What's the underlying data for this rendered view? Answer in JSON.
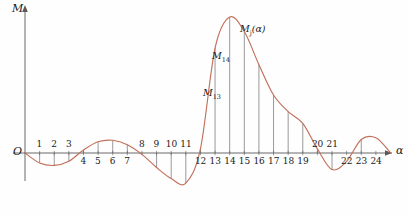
{
  "figure": {
    "axis_labels": {
      "y": "M",
      "x": "α",
      "origin": "O"
    },
    "annotations": [
      {
        "name": "M13",
        "text": "M",
        "subscript": "13",
        "x": 203,
        "y": 88
      },
      {
        "name": "M14",
        "text": "M",
        "subscript": "14",
        "x": 212,
        "y": 51
      },
      {
        "name": "Mj-alpha",
        "text": "M",
        "subscript": "j",
        "suffix": "(α)",
        "x": 240,
        "y": 24
      }
    ],
    "curve_color": "#c1705a",
    "axis_color": "#5a5a5a",
    "dropline_color": "#6e6e6e",
    "tick_labels": [
      "1",
      "2",
      "3",
      "4",
      "5",
      "6",
      "7",
      "8",
      "9",
      "10",
      "11",
      "12",
      "13",
      "14",
      "15",
      "16",
      "17",
      "18",
      "19",
      "20",
      "21",
      "22",
      "23",
      "24"
    ]
  },
  "chart_data": {
    "type": "line",
    "title": "",
    "xlabel": "α",
    "ylabel": "M",
    "xlim": [
      0,
      25.5
    ],
    "ylim": [
      -0.38,
      1.05
    ],
    "grid": false,
    "legend": "none",
    "series": [
      {
        "name": "M_j(alpha)",
        "color": "#c1705a",
        "x": [
          0,
          1,
          2,
          3,
          4,
          5,
          6,
          7,
          8,
          9,
          10,
          11,
          12,
          13,
          14,
          15,
          16,
          17,
          18,
          19,
          20,
          21,
          22,
          23,
          24,
          25
        ],
        "y": [
          0.0,
          -0.072,
          -0.09,
          -0.06,
          0.022,
          0.082,
          0.092,
          0.06,
          -0.01,
          -0.105,
          -0.185,
          -0.218,
          0.03,
          0.76,
          0.985,
          0.88,
          0.64,
          0.42,
          0.3,
          0.215,
          0.03,
          -0.12,
          -0.06,
          0.098,
          0.11,
          0.002
        ]
      }
    ],
    "droplines": [
      {
        "x": 1,
        "y": -0.072
      },
      {
        "x": 2,
        "y": -0.09
      },
      {
        "x": 3,
        "y": -0.06
      },
      {
        "x": 4,
        "y": 0.022
      },
      {
        "x": 5,
        "y": 0.082
      },
      {
        "x": 6,
        "y": 0.092
      },
      {
        "x": 7,
        "y": 0.06
      },
      {
        "x": 8,
        "y": -0.01
      },
      {
        "x": 9,
        "y": -0.105
      },
      {
        "x": 10,
        "y": -0.185
      },
      {
        "x": 11,
        "y": -0.218
      },
      {
        "x": 12,
        "y": 0.03
      },
      {
        "x": 13,
        "y": 0.76
      },
      {
        "x": 14,
        "y": 0.985
      },
      {
        "x": 15,
        "y": 0.88
      },
      {
        "x": 16,
        "y": 0.64
      },
      {
        "x": 17,
        "y": 0.42
      },
      {
        "x": 18,
        "y": 0.3
      },
      {
        "x": 19,
        "y": 0.215
      },
      {
        "x": 20,
        "y": 0.03
      },
      {
        "x": 21,
        "y": -0.12
      },
      {
        "x": 23,
        "y": 0.098
      }
    ],
    "tick_label_side": {
      "above_axis": [
        1,
        2,
        3,
        8,
        9,
        10,
        11,
        20,
        21
      ],
      "below_axis": [
        4,
        5,
        6,
        7,
        12,
        13,
        14,
        15,
        16,
        17,
        18,
        19,
        22,
        23,
        24
      ]
    }
  }
}
